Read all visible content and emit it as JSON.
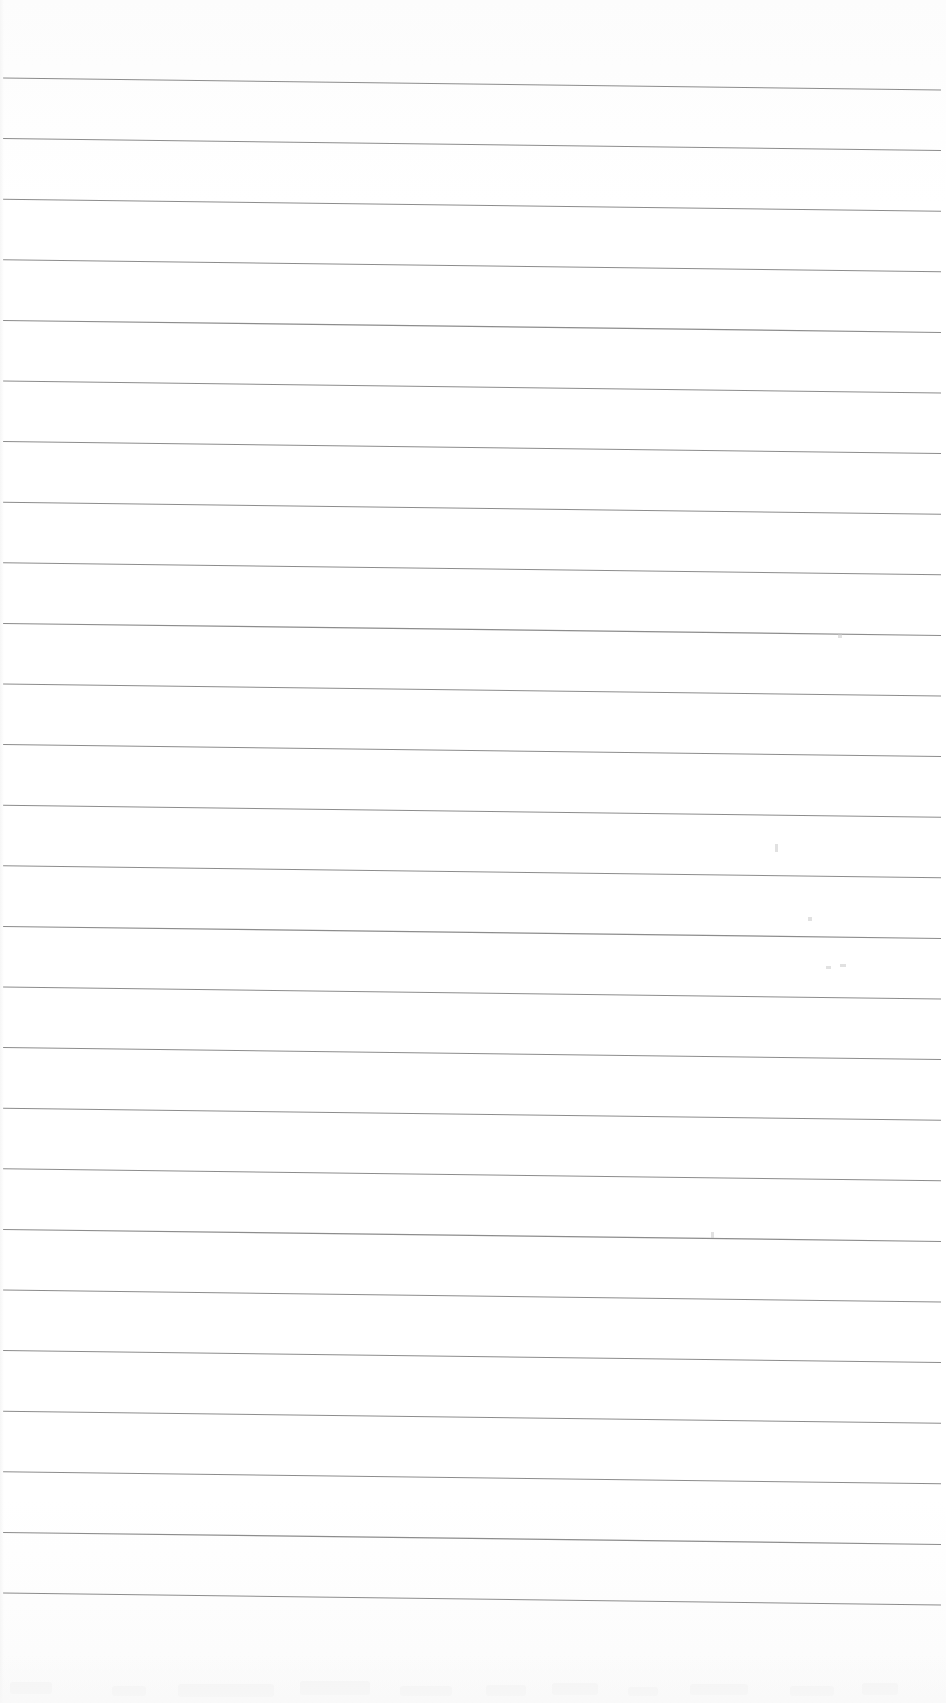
{
  "document": {
    "kind": "scanned-ruled-notebook-page",
    "title": "Blank Ruled Page",
    "page_width": 946,
    "page_height": 1703,
    "background_color": "#fefefe",
    "has_visible_text": false,
    "written_content": ""
  },
  "ruling": {
    "line_color": "#8c8c8c",
    "line_width_px": 1.05,
    "line_count": 26,
    "spacing_px": 60.6,
    "first_line_y_left": 78,
    "left_margin_x": 3,
    "right_margin_x": 941,
    "slope_drop_px": 12,
    "orientation": "horizontal-slight-downward-slope",
    "lines": [
      {
        "index": 1,
        "y_left": 78.0,
        "y_right": 90.0
      },
      {
        "index": 2,
        "y_left": 138.6,
        "y_right": 150.6
      },
      {
        "index": 3,
        "y_left": 199.2,
        "y_right": 211.2
      },
      {
        "index": 4,
        "y_left": 259.8,
        "y_right": 271.8
      },
      {
        "index": 5,
        "y_left": 320.4,
        "y_right": 332.4
      },
      {
        "index": 6,
        "y_left": 381.0,
        "y_right": 393.0
      },
      {
        "index": 7,
        "y_left": 441.6,
        "y_right": 453.6
      },
      {
        "index": 8,
        "y_left": 502.2,
        "y_right": 514.2
      },
      {
        "index": 9,
        "y_left": 562.8,
        "y_right": 574.8
      },
      {
        "index": 10,
        "y_left": 623.4,
        "y_right": 635.4
      },
      {
        "index": 11,
        "y_left": 684.0,
        "y_right": 696.0
      },
      {
        "index": 12,
        "y_left": 744.6,
        "y_right": 756.6
      },
      {
        "index": 13,
        "y_left": 805.2,
        "y_right": 817.2
      },
      {
        "index": 14,
        "y_left": 865.8,
        "y_right": 877.8
      },
      {
        "index": 15,
        "y_left": 926.4,
        "y_right": 938.4
      },
      {
        "index": 16,
        "y_left": 987.0,
        "y_right": 999.0
      },
      {
        "index": 17,
        "y_left": 1047.6,
        "y_right": 1059.6
      },
      {
        "index": 18,
        "y_left": 1108.2,
        "y_right": 1120.2
      },
      {
        "index": 19,
        "y_left": 1168.8,
        "y_right": 1180.8
      },
      {
        "index": 20,
        "y_left": 1229.4,
        "y_right": 1241.4
      },
      {
        "index": 21,
        "y_left": 1290.0,
        "y_right": 1302.0
      },
      {
        "index": 22,
        "y_left": 1350.6,
        "y_right": 1362.6
      },
      {
        "index": 23,
        "y_left": 1411.2,
        "y_right": 1423.2
      },
      {
        "index": 24,
        "y_left": 1471.8,
        "y_right": 1483.8
      },
      {
        "index": 25,
        "y_left": 1532.4,
        "y_right": 1544.4
      },
      {
        "index": 26,
        "y_left": 1593.0,
        "y_right": 1605.0
      }
    ]
  },
  "scan_artifacts": {
    "mark_color": "#c9c9c9",
    "smudge_color": "#f2f2f2",
    "marks": [
      {
        "name": "speck-upper-right",
        "x": 838,
        "y": 633,
        "w": 4,
        "h": 5
      },
      {
        "name": "speck-mid-right",
        "x": 775,
        "y": 844,
        "w": 3,
        "h": 8
      },
      {
        "name": "speck-mid-right-2",
        "x": 808,
        "y": 917,
        "w": 4,
        "h": 4
      },
      {
        "name": "speck-right-pair-a",
        "x": 826,
        "y": 966,
        "w": 5,
        "h": 3
      },
      {
        "name": "speck-right-pair-b",
        "x": 840,
        "y": 964,
        "w": 6,
        "h": 3
      },
      {
        "name": "speck-lower-center",
        "x": 711,
        "y": 1232,
        "w": 3,
        "h": 6
      }
    ],
    "bottom_smudges": [
      {
        "name": "smudge-a",
        "x": 10,
        "y": 1682,
        "w": 42,
        "h": 12
      },
      {
        "name": "smudge-b",
        "x": 112,
        "y": 1686,
        "w": 34,
        "h": 10
      },
      {
        "name": "smudge-c",
        "x": 178,
        "y": 1684,
        "w": 96,
        "h": 13
      },
      {
        "name": "smudge-d",
        "x": 300,
        "y": 1681,
        "w": 70,
        "h": 14
      },
      {
        "name": "smudge-e",
        "x": 400,
        "y": 1686,
        "w": 52,
        "h": 10
      },
      {
        "name": "smudge-f",
        "x": 486,
        "y": 1685,
        "w": 40,
        "h": 11
      },
      {
        "name": "smudge-g",
        "x": 552,
        "y": 1683,
        "w": 46,
        "h": 12
      },
      {
        "name": "smudge-h",
        "x": 628,
        "y": 1687,
        "w": 30,
        "h": 9
      },
      {
        "name": "smudge-i",
        "x": 690,
        "y": 1684,
        "w": 58,
        "h": 11
      },
      {
        "name": "smudge-j",
        "x": 790,
        "y": 1686,
        "w": 44,
        "h": 10
      },
      {
        "name": "smudge-k",
        "x": 862,
        "y": 1683,
        "w": 36,
        "h": 12
      }
    ]
  },
  "accessibility": {
    "description": "Scanned blank ruled notebook page with 26 faint gray horizontal rules sloping slightly downward to the right."
  }
}
